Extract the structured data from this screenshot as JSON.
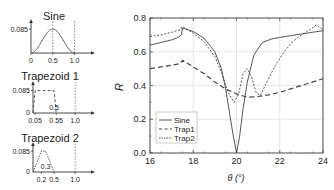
{
  "chart_data": [
    {
      "type": "line",
      "name": "inset-sine",
      "title": "Sine",
      "xlim": [
        0,
        1.4
      ],
      "ylim": [
        0,
        0.11
      ],
      "ytick_label": "0.085",
      "ytick_value": 0.085,
      "xticks": [
        {
          "value": 0,
          "label": "0"
        },
        {
          "value": 0.5,
          "label": "0.5"
        },
        {
          "value": 1.0,
          "label": "1.0"
        }
      ],
      "annotation": "",
      "dashed_markers": [
        0.5,
        1.0
      ],
      "profile": {
        "kind": "sine",
        "start": 0,
        "end": 1.0,
        "peak": 0.085
      }
    },
    {
      "type": "line",
      "name": "inset-trapezoid-1",
      "title": "Trapezoid  1",
      "xlim": [
        0,
        1.4
      ],
      "ylim": [
        0,
        0.11
      ],
      "ytick_label": "0.085",
      "ytick_value": 0.085,
      "yzero_label": "0",
      "xticks": [
        {
          "value": 0.05,
          "label": "0.05"
        },
        {
          "value": 0.55,
          "label": "0.55"
        },
        {
          "value": 1.0,
          "label": "1.0"
        }
      ],
      "annotation": "0.5",
      "dashed_markers": [
        1.0
      ],
      "profile": {
        "kind": "trapezoid",
        "points": [
          [
            0.0,
            0
          ],
          [
            0.05,
            0.085
          ],
          [
            0.5,
            0.085
          ],
          [
            0.55,
            0
          ]
        ]
      }
    },
    {
      "type": "line",
      "name": "inset-trapezoid-2",
      "title": "Trapezoid  2",
      "xlim": [
        0,
        1.4
      ],
      "ylim": [
        0,
        0.11
      ],
      "ytick_label": "0.085",
      "ytick_value": 0.085,
      "yzero_label": "0",
      "xticks": [
        {
          "value": 0.2,
          "label": "0.2"
        },
        {
          "value": 0.5,
          "label": "0.5"
        },
        {
          "value": 1.0,
          "label": "1.0"
        }
      ],
      "annotation": "0.3",
      "dashed_markers": [
        1.0
      ],
      "profile": {
        "kind": "trapezoid",
        "points": [
          [
            0.0,
            0
          ],
          [
            0.2,
            0.085
          ],
          [
            0.3,
            0.085
          ],
          [
            0.5,
            0
          ]
        ]
      }
    },
    {
      "type": "line",
      "name": "main-reflectance",
      "title": "",
      "xlabel": "θ (°)",
      "ylabel": "R",
      "xlim": [
        16,
        24
      ],
      "ylim": [
        0,
        0.8
      ],
      "xticks": [
        16,
        18,
        20,
        22,
        24
      ],
      "yticks": [
        0.0,
        0.2,
        0.4,
        0.6,
        0.8
      ],
      "ytick_labels": [
        "0.0",
        "0.2",
        "0.4",
        "0.6",
        "0.8"
      ],
      "grid": true,
      "legend": "bottom-left",
      "series": [
        {
          "name": "Sine",
          "style": "solid",
          "x": [
            16.0,
            16.5,
            17.0,
            17.3,
            17.45,
            17.5,
            18.0,
            18.5,
            19.0,
            19.3,
            19.5,
            19.7,
            19.85,
            20.0,
            20.15,
            20.3,
            20.5,
            20.8,
            21.2,
            21.6,
            22.0,
            22.5,
            23.0,
            23.5,
            24.0
          ],
          "y": [
            0.64,
            0.655,
            0.67,
            0.685,
            0.7,
            0.74,
            0.72,
            0.68,
            0.6,
            0.5,
            0.38,
            0.22,
            0.1,
            0.0,
            0.1,
            0.26,
            0.42,
            0.58,
            0.655,
            0.675,
            0.685,
            0.695,
            0.705,
            0.715,
            0.725
          ]
        },
        {
          "name": "Trap1",
          "style": "dashed",
          "x": [
            16.0,
            16.5,
            17.0,
            17.4,
            17.5,
            18.0,
            18.5,
            19.0,
            19.5,
            20.0,
            20.5,
            21.0,
            21.5,
            22.0,
            22.5,
            23.0,
            23.5,
            24.0
          ],
          "y": [
            0.5,
            0.51,
            0.52,
            0.53,
            0.55,
            0.51,
            0.47,
            0.42,
            0.38,
            0.35,
            0.33,
            0.335,
            0.345,
            0.36,
            0.38,
            0.4,
            0.42,
            0.44
          ]
        },
        {
          "name": "Trap2",
          "style": "dotted",
          "x": [
            16.0,
            16.5,
            17.0,
            17.4,
            17.5,
            18.0,
            18.5,
            19.0,
            19.3,
            19.6,
            19.9,
            20.1,
            20.3,
            20.5,
            20.7,
            20.9,
            21.1,
            21.4,
            21.8,
            22.2,
            22.6,
            23.0,
            23.4,
            23.7,
            24.0
          ],
          "y": [
            0.69,
            0.7,
            0.715,
            0.73,
            0.75,
            0.71,
            0.66,
            0.57,
            0.48,
            0.36,
            0.3,
            0.35,
            0.47,
            0.5,
            0.45,
            0.36,
            0.34,
            0.42,
            0.52,
            0.6,
            0.66,
            0.7,
            0.73,
            0.76,
            0.73
          ]
        }
      ]
    }
  ]
}
